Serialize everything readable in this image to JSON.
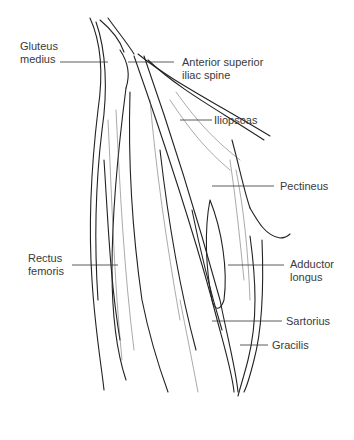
{
  "figure": {
    "type": "anatomical illustration",
    "colors": {
      "ink": "#222222",
      "label": "#3a3a3a",
      "background": "#ffffff"
    }
  },
  "labels": {
    "gluteus_medius": {
      "line1": "Gluteus",
      "line2": "medius"
    },
    "asis": {
      "line1": "Anterior superior",
      "line2": "iliac spine"
    },
    "iliopsoas": "Iliopsoas",
    "pectineus": "Pectineus",
    "rectus_femoris": {
      "line1": "Rectus",
      "line2": "femoris"
    },
    "adductor_longus": {
      "line1": "Adductor",
      "line2": "longus"
    },
    "sartorius": "Sartorius",
    "gracilis": "Gracilis"
  }
}
